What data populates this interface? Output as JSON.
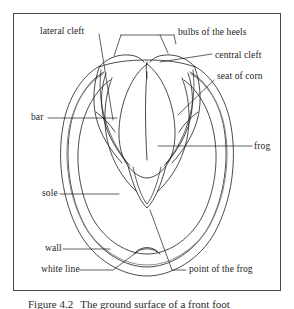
{
  "figure": {
    "caption_label": "Figure 4.2",
    "caption_text": "The ground surface of a front foot",
    "frame_color": "#4a4a4a",
    "line_color": "#1c1c1c",
    "background_color": "#ffffff"
  },
  "labels": [
    {
      "id": "lateral-cleft",
      "text": "lateral  cleft",
      "x": 40,
      "y": 32
    },
    {
      "id": "bulbs-of-the-heels",
      "text": "bulbs of the heels",
      "x": 178,
      "y": 33
    },
    {
      "id": "central-cleft",
      "text": "central cleft",
      "x": 215,
      "y": 56
    },
    {
      "id": "seat-of-corn",
      "text": "seat of corn",
      "x": 217,
      "y": 77
    },
    {
      "id": "bar",
      "text": "bar",
      "x": 31,
      "y": 118
    },
    {
      "id": "frog",
      "text": "frog",
      "x": 254,
      "y": 147
    },
    {
      "id": "sole",
      "text": "sole",
      "x": 42,
      "y": 193
    },
    {
      "id": "wall",
      "text": "wall",
      "x": 45,
      "y": 248
    },
    {
      "id": "white-line",
      "text": "white line",
      "x": 41,
      "y": 269
    },
    {
      "id": "point-of-the-frog",
      "text": "point of the frog",
      "x": 189,
      "y": 269
    }
  ]
}
